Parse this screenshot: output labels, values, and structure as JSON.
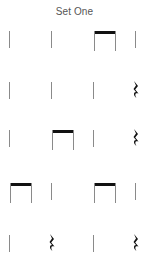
{
  "title": "Set One",
  "colors": {
    "stem": "#8a8a8a",
    "beam": "#111111",
    "rest": "#111111",
    "title": "#555555"
  },
  "rows": [
    {
      "beats": [
        "quarter",
        "quarter",
        "eighth-pair",
        "quarter"
      ]
    },
    {
      "beats": [
        "quarter",
        "quarter",
        "quarter",
        "quarter-rest"
      ]
    },
    {
      "beats": [
        "quarter",
        "eighth-pair",
        "quarter",
        "quarter-rest"
      ]
    },
    {
      "beats": [
        "eighth-pair",
        "quarter",
        "eighth-pair",
        "quarter"
      ]
    },
    {
      "beats": [
        "quarter",
        "quarter-rest",
        "quarter",
        "quarter-rest"
      ]
    }
  ]
}
